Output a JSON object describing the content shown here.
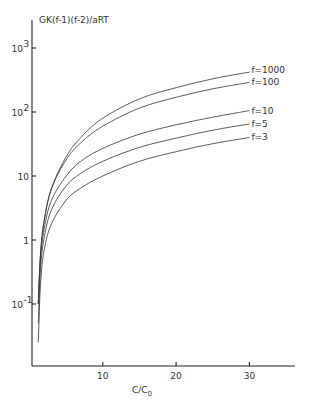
{
  "chart_data": {
    "type": "line",
    "title": "",
    "ylabel": "GK(f-1)(f-2)/aRT",
    "xlabel": "C/C0",
    "xlabel_main": "C/C",
    "xlabel_sub": "0",
    "yscale": "log",
    "xlim": [
      0,
      36
    ],
    "ylim": [
      0.02,
      3000
    ],
    "grid": false,
    "x_ticks": [
      10,
      20,
      30
    ],
    "x_tick_labels": [
      "10",
      "20",
      "30"
    ],
    "y_ticks": [
      0.1,
      1,
      10,
      100,
      1000
    ],
    "y_tick_labels": [
      {
        "base": "10",
        "exp": "-1"
      },
      {
        "base": "1",
        "exp": ""
      },
      {
        "base": "10",
        "exp": ""
      },
      {
        "base": "10",
        "exp": "2"
      },
      {
        "base": "10",
        "exp": "3"
      }
    ],
    "legend_position": "inline labels at right end of curves",
    "x": [
      1.2,
      1.5,
      2,
      3,
      5,
      7,
      10,
      15,
      20,
      25,
      30
    ],
    "series": [
      {
        "name": "f=1000",
        "values": [
          0.1,
          0.6,
          2.0,
          6.5,
          20,
          40,
          80,
          160,
          240,
          330,
          420
        ]
      },
      {
        "name": "f=100",
        "values": [
          0.1,
          0.6,
          2.0,
          6.3,
          18,
          33,
          60,
          115,
          170,
          230,
          290
        ]
      },
      {
        "name": "f=10",
        "values": [
          0.1,
          0.5,
          1.5,
          4.2,
          10,
          17,
          27,
          45,
          63,
          83,
          105
        ]
      },
      {
        "name": "f=5",
        "values": [
          0.05,
          0.35,
          1.1,
          3.0,
          7,
          11,
          17,
          28,
          39,
          52,
          65
        ]
      },
      {
        "name": "f=3",
        "values": [
          0.025,
          0.2,
          0.7,
          1.8,
          4.2,
          6.5,
          10,
          17,
          24,
          32,
          40
        ]
      }
    ]
  }
}
